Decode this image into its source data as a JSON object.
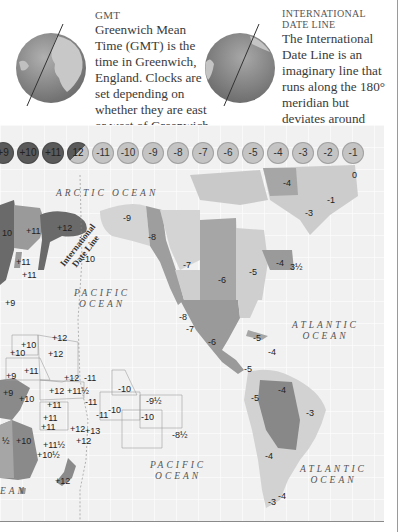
{
  "gmt_panel": {
    "heading": "GMT",
    "body": "Greenwich Mean Time (GMT) is the time in Greenwich, England. Clocks are set depending on whether they are east or west of Greenwich."
  },
  "idl_panel": {
    "heading_line1": "International",
    "heading_line2": "Date Line",
    "body": "The International Date Line is an imaginary line that runs along the 180° meridian but deviates around countries."
  },
  "timezone_bar": [
    {
      "label": "+9",
      "shade": "dark"
    },
    {
      "label": "+10",
      "shade": "dark"
    },
    {
      "label": "+11",
      "shade": "dark"
    },
    {
      "label": "12",
      "shade": "split"
    },
    {
      "label": "-11",
      "shade": "light"
    },
    {
      "label": "-10",
      "shade": "light"
    },
    {
      "label": "-9",
      "shade": "light"
    },
    {
      "label": "-8",
      "shade": "light"
    },
    {
      "label": "-7",
      "shade": "light"
    },
    {
      "label": "-6",
      "shade": "light"
    },
    {
      "label": "-5",
      "shade": "light"
    },
    {
      "label": "-4",
      "shade": "light"
    },
    {
      "label": "-3",
      "shade": "light"
    },
    {
      "label": "-2",
      "shade": "light"
    },
    {
      "label": "-1",
      "shade": "light"
    }
  ],
  "map": {
    "oceans": {
      "arctic": "ARCTIC OCEAN",
      "pacific_north_1": "PACIFIC",
      "pacific_north_2": "OCEAN",
      "atlantic_north_1": "ATLANTIC",
      "atlantic_north_2": "OCEAN",
      "pacific_south_1": "PACIFIC",
      "pacific_south_2": "OCEAN",
      "atlantic_south_1": "ATLANTIC",
      "atlantic_south_2": "OCEAN",
      "indian_fragment": "EAN"
    },
    "date_line_label_1": "International",
    "date_line_label_2": "Date Line",
    "zone_labels": [
      {
        "text": "10",
        "x": 2,
        "y": 228
      },
      {
        "text": "+11",
        "x": 26,
        "y": 226
      },
      {
        "text": "+12",
        "x": 57,
        "y": 223
      },
      {
        "text": "-9",
        "x": 123,
        "y": 213
      },
      {
        "text": "-8",
        "x": 148,
        "y": 232
      },
      {
        "text": "-10",
        "x": 82,
        "y": 254
      },
      {
        "text": "+11",
        "x": 16,
        "y": 257
      },
      {
        "text": "+11",
        "x": 22,
        "y": 270
      },
      {
        "text": "-7",
        "x": 183,
        "y": 260
      },
      {
        "text": "-4",
        "x": 283,
        "y": 178
      },
      {
        "text": "0",
        "x": 352,
        "y": 170
      },
      {
        "text": "-1",
        "x": 327,
        "y": 195
      },
      {
        "text": "-3",
        "x": 305,
        "y": 208
      },
      {
        "text": "-6",
        "x": 218,
        "y": 275
      },
      {
        "text": "-5",
        "x": 249,
        "y": 267
      },
      {
        "text": "-4",
        "x": 276,
        "y": 258
      },
      {
        "text": "3½",
        "x": 290,
        "y": 262
      },
      {
        "text": "+9",
        "x": 5,
        "y": 298
      },
      {
        "text": "-8",
        "x": 179,
        "y": 312
      },
      {
        "text": "-7",
        "x": 186,
        "y": 324
      },
      {
        "text": "+12",
        "x": 52,
        "y": 333
      },
      {
        "text": "+10",
        "x": 21,
        "y": 340
      },
      {
        "text": "+12",
        "x": 48,
        "y": 349
      },
      {
        "text": "+10",
        "x": 10,
        "y": 348
      },
      {
        "text": "+11",
        "x": 24,
        "y": 366
      },
      {
        "text": "+9",
        "x": 6,
        "y": 371
      },
      {
        "text": "+12",
        "x": 64,
        "y": 373
      },
      {
        "text": "-11",
        "x": 84,
        "y": 373
      },
      {
        "text": "+12",
        "x": 49,
        "y": 386
      },
      {
        "text": "+11½",
        "x": 67,
        "y": 386
      },
      {
        "text": "-10",
        "x": 118,
        "y": 384
      },
      {
        "text": "+9",
        "x": 3,
        "y": 388
      },
      {
        "text": "+10",
        "x": 19,
        "y": 394
      },
      {
        "text": "+11",
        "x": 47,
        "y": 400
      },
      {
        "text": "-11",
        "x": 85,
        "y": 397
      },
      {
        "text": "-10",
        "x": 108,
        "y": 405
      },
      {
        "text": "-9½",
        "x": 146,
        "y": 396
      },
      {
        "text": "-10",
        "x": 141,
        "y": 412
      },
      {
        "text": "+11",
        "x": 43,
        "y": 413
      },
      {
        "text": "+11",
        "x": 41,
        "y": 422
      },
      {
        "text": "+12",
        "x": 70,
        "y": 424
      },
      {
        "text": "+13",
        "x": 85,
        "y": 426
      },
      {
        "text": "-11",
        "x": 96,
        "y": 410
      },
      {
        "text": "+12",
        "x": 76,
        "y": 436
      },
      {
        "text": "-8½",
        "x": 172,
        "y": 430
      },
      {
        "text": "+11½",
        "x": 43,
        "y": 440
      },
      {
        "text": "+10½",
        "x": 37,
        "y": 450
      },
      {
        "text": "+10",
        "x": 16,
        "y": 436
      },
      {
        "text": "½",
        "x": 2,
        "y": 436
      },
      {
        "text": "+12",
        "x": 55,
        "y": 476
      },
      {
        "text": "-6",
        "x": 208,
        "y": 337
      },
      {
        "text": "-5",
        "x": 253,
        "y": 333
      },
      {
        "text": "-4",
        "x": 268,
        "y": 347
      },
      {
        "text": "-5",
        "x": 244,
        "y": 364
      },
      {
        "text": "-4",
        "x": 278,
        "y": 385
      },
      {
        "text": "-5",
        "x": 251,
        "y": 393
      },
      {
        "text": "-3",
        "x": 306,
        "y": 408
      },
      {
        "text": "-4",
        "x": 265,
        "y": 451
      },
      {
        "text": "-4",
        "x": 278,
        "y": 491
      },
      {
        "text": "-3",
        "x": 268,
        "y": 497
      }
    ]
  },
  "colors": {
    "dark_zone": "#5a5a5a",
    "mid_zone": "#8c8c8c",
    "light_zone": "#c4c4c4",
    "pale_land": "#d8d8d8",
    "sea": "#f1f1f1"
  }
}
